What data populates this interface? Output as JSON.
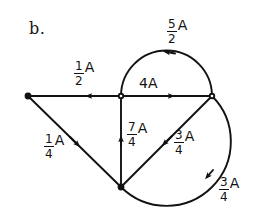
{
  "figure": {
    "part_label": "b.",
    "unit_symbol": "A",
    "ink_color": "#121212",
    "background_color": "#ffffff",
    "width": 255,
    "height": 220
  },
  "vertices": [
    {
      "id": "left",
      "name": "vertex-left",
      "x": 28,
      "y": 96
    },
    {
      "id": "center",
      "name": "vertex-center",
      "x": 121,
      "y": 96
    },
    {
      "id": "right",
      "name": "vertex-right",
      "x": 212,
      "y": 96
    },
    {
      "id": "bottom",
      "name": "vertex-bottom",
      "x": 121,
      "y": 187
    }
  ],
  "edges": [
    {
      "id": "left-center-straight",
      "name": "edge-left-center",
      "from": "center",
      "to": "left",
      "shape": "straight",
      "flow_direction": "leftward",
      "label": {
        "numerator": "1",
        "denominator": "2",
        "unit": "A",
        "text": "1/2 A"
      }
    },
    {
      "id": "center-right-straight",
      "name": "edge-center-right",
      "from": "center",
      "to": "right",
      "shape": "straight",
      "flow_direction": "rightward",
      "label": {
        "numerator": null,
        "denominator": null,
        "value": "4",
        "unit": "A",
        "text": "4A"
      }
    },
    {
      "id": "center-right-arc-top",
      "name": "edge-upper-semicircle",
      "from": "right",
      "to": "center",
      "shape": "arc-above",
      "flow_direction": "leftward",
      "label": {
        "numerator": "5",
        "denominator": "2",
        "unit": "A",
        "text": "5/2 A"
      }
    },
    {
      "id": "bottom-center-vertical",
      "name": "edge-bottom-center",
      "from": "bottom",
      "to": "center",
      "shape": "straight",
      "flow_direction": "upward",
      "label": {
        "numerator": "7",
        "denominator": "4",
        "unit": "A",
        "text": "7/4 A"
      }
    },
    {
      "id": "left-bottom-diagonal",
      "name": "edge-left-bottom",
      "from": "left",
      "to": "bottom",
      "shape": "straight",
      "flow_direction": "down-right",
      "label": {
        "numerator": "1",
        "denominator": "4",
        "unit": "A",
        "text": "1/4 A"
      }
    },
    {
      "id": "right-bottom-diagonal",
      "name": "edge-right-bottom",
      "from": "right",
      "to": "bottom",
      "shape": "straight",
      "flow_direction": "down-left",
      "label": {
        "numerator": "3",
        "denominator": "4",
        "unit": "A",
        "text": "3/4 A"
      }
    },
    {
      "id": "right-bottom-arc",
      "name": "edge-lower-arc",
      "from": "right",
      "to": "bottom",
      "shape": "arc-right",
      "flow_direction": "clockwise-down",
      "label": {
        "numerator": "3",
        "denominator": "4",
        "unit": "A",
        "text": "3/4 A"
      }
    }
  ],
  "labels": {
    "upper_semicircle": {
      "numerator": "5",
      "denominator": "2",
      "unit": "A"
    },
    "left_horizontal": {
      "numerator": "1",
      "denominator": "2",
      "unit": "A"
    },
    "center_horizontal": {
      "value": "4",
      "unit": "A"
    },
    "vertical": {
      "numerator": "7",
      "denominator": "4",
      "unit": "A"
    },
    "lower_left_diagonal": {
      "numerator": "1",
      "denominator": "4",
      "unit": "A"
    },
    "inner_diagonal": {
      "numerator": "3",
      "denominator": "4",
      "unit": "A"
    },
    "lower_arc": {
      "numerator": "3",
      "denominator": "4",
      "unit": "A"
    }
  }
}
